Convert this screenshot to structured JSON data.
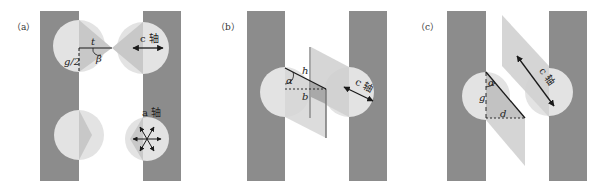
{
  "figure": {
    "colors": {
      "background": "#ffffff",
      "bar": "#8c8c8c",
      "circle": "#e3e3e3",
      "wedge": "#c8c8c8",
      "plane": "#cfcfcf",
      "plane_dark": "#a9a9a9",
      "line": "#1a1a1a"
    },
    "panels": [
      {
        "id": "a",
        "label": "（a）",
        "annotations": {
          "t": "t",
          "beta": "β",
          "g_half": "g/2",
          "c_axis": "c 轴",
          "a_axis": "a 轴"
        }
      },
      {
        "id": "b",
        "label": "（b）",
        "annotations": {
          "h": "h",
          "alpha": "α",
          "b": "b",
          "c_axis": "c 轴"
        }
      },
      {
        "id": "c",
        "label": "（c）",
        "annotations": {
          "alpha": "α",
          "g": "g",
          "d": "d",
          "c_axis": "c 轴"
        }
      }
    ]
  }
}
